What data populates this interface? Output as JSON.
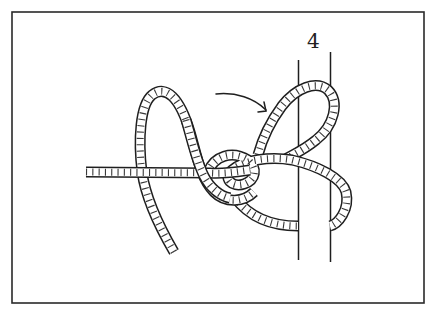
{
  "diagram": {
    "type": "knot-tying-step",
    "step_label": "4",
    "colors": {
      "line": "#1f1f1f",
      "background": "#ffffff"
    },
    "elements": [
      {
        "name": "frame",
        "kind": "border"
      },
      {
        "name": "pole",
        "kind": "two vertical lines"
      },
      {
        "name": "standing-part",
        "kind": "rope"
      },
      {
        "name": "left-loop",
        "kind": "rope"
      },
      {
        "name": "right-loop",
        "kind": "rope"
      },
      {
        "name": "lower-loop",
        "kind": "rope"
      },
      {
        "name": "direction-arrow",
        "kind": "curved arrow"
      }
    ]
  }
}
